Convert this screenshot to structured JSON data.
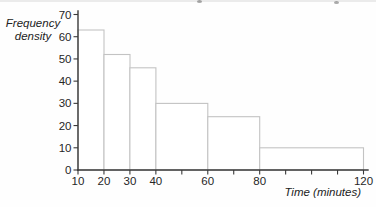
{
  "chart_data": {
    "type": "bar",
    "subtype": "histogram",
    "title": "",
    "xlabel": "Time (minutes)",
    "ylabel": "Frequency\ndensity",
    "xlim": [
      10,
      120
    ],
    "ylim": [
      0,
      70
    ],
    "grid": false,
    "y_ticks": [
      0,
      10,
      20,
      30,
      40,
      50,
      60,
      70
    ],
    "x_ticks": [
      10,
      20,
      30,
      40,
      50,
      60,
      70,
      80,
      90,
      100,
      110,
      120
    ],
    "x_tick_labels": [
      "10",
      "20",
      "30",
      "40",
      "",
      "60",
      "",
      "80",
      "",
      "",
      "",
      "120"
    ],
    "bins": [
      {
        "from": 10,
        "to": 20,
        "frequency_density": 63
      },
      {
        "from": 20,
        "to": 30,
        "frequency_density": 52
      },
      {
        "from": 30,
        "to": 40,
        "frequency_density": 46
      },
      {
        "from": 40,
        "to": 60,
        "frequency_density": 30
      },
      {
        "from": 60,
        "to": 80,
        "frequency_density": 24
      },
      {
        "from": 80,
        "to": 120,
        "frequency_density": 10
      }
    ],
    "colors": {
      "axis": "#3a3a3a",
      "bar_outline": "#c3c3c3",
      "bar_fill": "#ffffff",
      "text": "#262626",
      "background": "#fefefe"
    }
  }
}
